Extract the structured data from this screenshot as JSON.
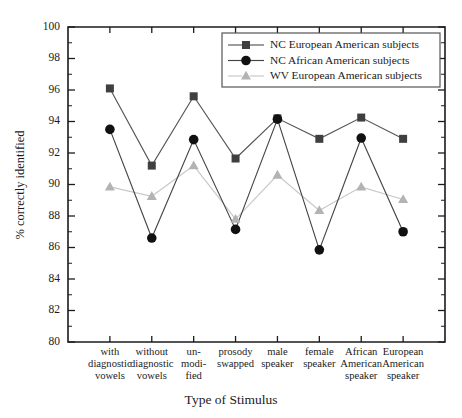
{
  "chart_data": {
    "type": "line",
    "title": "",
    "xlabel": "Type of Stimulus",
    "ylabel": "% correctly identified",
    "ylim": [
      80,
      100
    ],
    "ytick_step": 2,
    "yminor_step": 1,
    "grid": false,
    "legend_position": "top-right",
    "ytick_labels": [
      "80",
      "82",
      "84",
      "86",
      "88",
      "90",
      "92",
      "94",
      "96",
      "98",
      "100"
    ],
    "categories": [
      "with diagnostic vowels",
      "without diagnostic vowels",
      "un-modified",
      "prosody swapped",
      "male speaker",
      "female speaker",
      "African American speaker",
      "European American speaker"
    ],
    "category_lines": [
      [
        "with",
        "diagnostic",
        "vowels"
      ],
      [
        "without",
        "diagnostic",
        "vowels"
      ],
      [
        "un-",
        "modi-",
        "fied"
      ],
      [
        "prosody",
        "swapped"
      ],
      [
        "male",
        "speaker"
      ],
      [
        "female",
        "speaker"
      ],
      [
        "African",
        "American",
        "speaker"
      ],
      [
        "European",
        "American",
        "speaker"
      ]
    ],
    "series": [
      {
        "name": "NC European American subjects",
        "marker": "square",
        "color": "#3f3f3f",
        "line_color": "#555555",
        "values": [
          96.1,
          91.2,
          95.6,
          91.65,
          94.2,
          92.9,
          94.25,
          92.9
        ]
      },
      {
        "name": "NC African American subjects",
        "marker": "circle",
        "color": "#111111",
        "line_color": "#444444",
        "values": [
          93.5,
          86.6,
          92.85,
          87.15,
          94.15,
          85.85,
          92.95,
          87.0
        ]
      },
      {
        "name": "WV European American subjects",
        "marker": "triangle",
        "color": "#b3b3b3",
        "line_color": "#c8c8c8",
        "values": [
          89.85,
          89.25,
          91.2,
          87.8,
          90.6,
          88.35,
          89.85,
          89.05
        ]
      }
    ]
  },
  "legend": {
    "entries": [
      "NC European American subjects",
      "NC African American subjects",
      "WV European American subjects"
    ]
  },
  "colors": {
    "axis": "#1b1b1b",
    "series_1": "#3f3f3f",
    "series_2": "#111111",
    "series_3": "#b3b3b3",
    "background": "#ffffff"
  }
}
